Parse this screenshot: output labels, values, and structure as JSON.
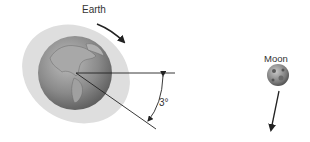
{
  "labels": {
    "earth": "Earth",
    "moon": "Moon",
    "angle": "3°"
  },
  "colors": {
    "tidal_bulge": "#dcdcdc",
    "earth_ocean": "#8a8a8a",
    "earth_land": "#b5b5b5",
    "moon": "#8c8c8c",
    "lines": "#222222"
  },
  "diagram": {
    "elements": [
      {
        "id": "earth",
        "type": "globe",
        "label": "Earth"
      },
      {
        "id": "tidal-bulge",
        "type": "ellipse",
        "description": "tilted tidal bulge around Earth"
      },
      {
        "id": "earth-rotation-arrow",
        "type": "arrow",
        "description": "Earth rotation direction"
      },
      {
        "id": "reference-line",
        "type": "line",
        "description": "horizontal line toward Moon"
      },
      {
        "id": "bulge-axis-line",
        "type": "line",
        "description": "bulge axis tilted line"
      },
      {
        "id": "angle-arc",
        "type": "arc",
        "label": "3°"
      },
      {
        "id": "moon",
        "type": "sphere",
        "label": "Moon"
      },
      {
        "id": "moon-orbit-arrow",
        "type": "arrow",
        "description": "Moon orbital motion"
      }
    ]
  }
}
